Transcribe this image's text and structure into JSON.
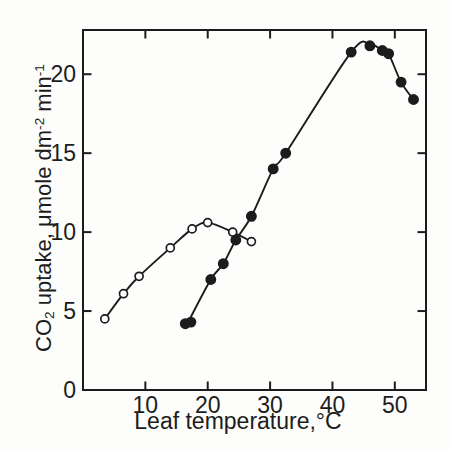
{
  "figure": {
    "xlabel": "Leaf temperature,°C",
    "ylabel": "CO₂ uptake, μmole dm⁻² min⁻¹",
    "ylabel_parts": {
      "co": "CO",
      "co_sub": "2",
      "mid": " uptake, μmole dm",
      "dm_sup": "-2",
      "min": " min",
      "min_sup": "-1"
    },
    "ink_color": "#1c1c1c",
    "background": "#fdfdfb"
  },
  "chart_data": {
    "type": "scatter",
    "title": "",
    "xlabel": "Leaf temperature,°C",
    "ylabel": "CO₂ uptake, μmole dm⁻² min⁻¹",
    "xlim": [
      0,
      55
    ],
    "ylim": [
      0,
      22.8
    ],
    "x_ticks": [
      10,
      20,
      30,
      40,
      50
    ],
    "y_ticks": [
      0,
      5,
      10,
      15,
      20
    ],
    "grid": false,
    "legend": "none",
    "frame": "box-with-mirrored-ticks",
    "series": [
      {
        "name": "open-circles",
        "marker": "open-circle",
        "line": "smooth",
        "color": "#1c1c1c",
        "points": [
          [
            3.5,
            4.5
          ],
          [
            6.5,
            6.1
          ],
          [
            9,
            7.2
          ],
          [
            14,
            9.0
          ],
          [
            17.5,
            10.2
          ],
          [
            20,
            10.6
          ],
          [
            24,
            10.0
          ],
          [
            27,
            9.4
          ]
        ]
      },
      {
        "name": "filled-circles",
        "marker": "filled-circle",
        "line": "smooth",
        "color": "#1c1c1c",
        "points": [
          [
            16.4,
            4.2
          ],
          [
            17.3,
            4.3
          ],
          [
            20.5,
            7.0
          ],
          [
            22.5,
            8.0
          ],
          [
            24.5,
            9.5
          ],
          [
            27,
            11.0
          ],
          [
            30.5,
            14.0
          ],
          [
            32.5,
            15.0
          ],
          [
            43,
            21.4
          ],
          [
            46,
            21.8
          ],
          [
            48,
            21.5
          ],
          [
            49,
            21.3
          ],
          [
            51,
            19.5
          ],
          [
            53,
            18.4
          ]
        ],
        "curve_points": [
          [
            16.8,
            4.25
          ],
          [
            20.5,
            7.0
          ],
          [
            22.5,
            8.0
          ],
          [
            24.5,
            9.5
          ],
          [
            27,
            11.0
          ],
          [
            30.5,
            14.0
          ],
          [
            32.5,
            15.0
          ],
          [
            43,
            21.4
          ],
          [
            46,
            21.9
          ],
          [
            48,
            21.5
          ],
          [
            49,
            21.3
          ],
          [
            51,
            19.5
          ],
          [
            53,
            18.4
          ]
        ]
      }
    ]
  }
}
